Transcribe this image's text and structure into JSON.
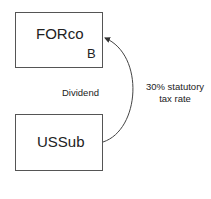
{
  "nodes": {
    "forco": {
      "label": "FORco",
      "sublabel": "B"
    },
    "ussub": {
      "label": "USSub"
    }
  },
  "edge": {
    "from": "USSub",
    "to": "FORco",
    "label": "Dividend"
  },
  "annotation": {
    "line1": "30% statutory",
    "line2": "tax rate"
  }
}
